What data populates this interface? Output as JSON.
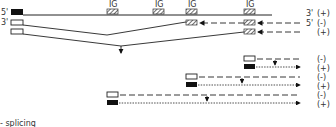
{
  "diagram": {
    "ig_label": "IG",
    "row_labels": [
      "5'",
      "3'"
    ],
    "strand_labels": {
      "r1": "3'",
      "r2": "5'"
    },
    "signs": [
      "(+)",
      "(-)",
      "(+)",
      "(-)",
      "(+)",
      "(-)",
      "(+)",
      "(-)",
      "(+)"
    ],
    "footer_text": "- splicing"
  }
}
